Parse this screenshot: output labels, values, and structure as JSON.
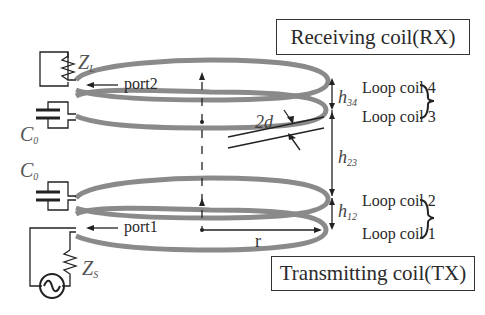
{
  "boxes": {
    "rx": "Receiving coil(RX)",
    "tx": "Transmitting coil(TX)"
  },
  "loop_labels": [
    "Loop coil 4",
    "Loop coil 3",
    "Loop coil 2",
    "Loop coil 1"
  ],
  "ports": {
    "port2": "port2",
    "port1": "port1"
  },
  "components": {
    "load": {
      "symbol": "Z",
      "sub": "L"
    },
    "source": {
      "symbol": "Z",
      "sub": "S"
    },
    "cap_top": {
      "symbol": "C",
      "sub": "0"
    },
    "cap_bottom": {
      "symbol": "C",
      "sub": "0"
    }
  },
  "dimensions": {
    "h34": {
      "symbol": "h",
      "sub": "34"
    },
    "h23": {
      "symbol": "h",
      "sub": "23"
    },
    "h12": {
      "symbol": "h",
      "sub": "12"
    },
    "wire": "2d",
    "radius": "r"
  },
  "colors": {
    "coil": "#8a8a8a",
    "line": "#222222"
  }
}
